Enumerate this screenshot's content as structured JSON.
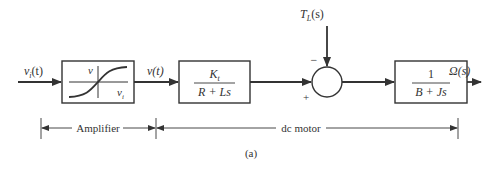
{
  "diagram": {
    "type": "block-diagram",
    "caption": "(a)",
    "colors": {
      "stroke": "#333333",
      "background": "#ffffff"
    },
    "signals": {
      "input": {
        "main": "v",
        "sub": "i",
        "arg": "(t)"
      },
      "amplifier_output": "v(t)",
      "disturbance": {
        "main": "T",
        "sub": "L",
        "arg": "(s)"
      },
      "output": "Ω(s)"
    },
    "blocks": [
      {
        "id": "amplifier",
        "kind": "saturation-curve",
        "y_axis_label": "v",
        "x_axis_label": {
          "main": "v",
          "sub": "i"
        }
      },
      {
        "id": "electrical",
        "numerator": {
          "main": "K",
          "sub": "t"
        },
        "denominator": "R + Ls"
      },
      {
        "id": "mechanical",
        "numerator": "1",
        "denominator": "B + Js"
      }
    ],
    "summing_junction": {
      "plus_sign": "+",
      "minus_sign": "−"
    },
    "brackets": [
      {
        "label": "Amplifier"
      },
      {
        "label": "dc motor"
      }
    ]
  }
}
